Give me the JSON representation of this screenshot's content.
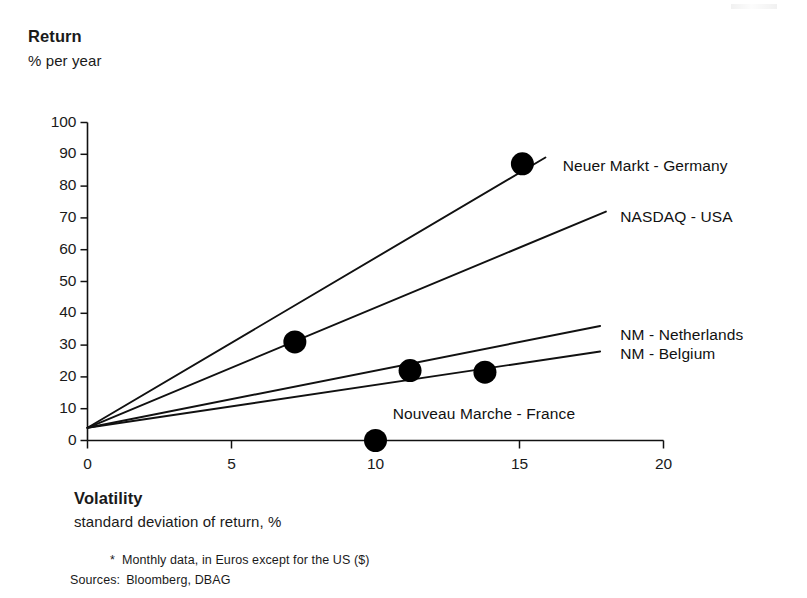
{
  "axis_titles": {
    "y_title": "Return",
    "y_subtitle": "% per year",
    "x_title": "Volatility",
    "x_subtitle": "standard deviation of return,   %"
  },
  "notes": {
    "footnote_marker": "*",
    "footnote_text": "Monthly data, in Euros except for the US ($)",
    "sources_label": "Sources:",
    "sources_text": "Bloomberg, DBAG"
  },
  "chart_data": {
    "type": "scatter",
    "title": "",
    "xlabel": "Volatility — standard deviation of return, %",
    "ylabel": "Return — % per year",
    "xlim": [
      0,
      20
    ],
    "ylim": [
      0,
      100
    ],
    "xticks": [
      0,
      5,
      10,
      15,
      20
    ],
    "yticks": [
      0,
      10,
      20,
      30,
      40,
      50,
      60,
      70,
      80,
      90,
      100
    ],
    "grid": false,
    "legend": "inline-right",
    "risk_free_intercept": 4,
    "series": [
      {
        "name": "Neuer Markt  - Germany",
        "label": "Neuer Markt  - Germany",
        "line": [
          [
            0,
            4
          ],
          [
            15.9,
            89
          ]
        ],
        "points": [
          [
            7.2,
            31
          ],
          [
            15.1,
            87
          ]
        ],
        "label_pos": [
          16.5,
          86
        ]
      },
      {
        "name": "NASDAQ - USA",
        "label": "NASDAQ - USA",
        "line": [
          [
            0,
            4
          ],
          [
            18.0,
            72
          ]
        ],
        "points": [],
        "label_pos": [
          18.5,
          70
        ]
      },
      {
        "name": "NM - Netherlands",
        "label": "NM - Netherlands",
        "line": [
          [
            0,
            4
          ],
          [
            17.8,
            36
          ]
        ],
        "points": [
          [
            11.2,
            22
          ],
          [
            13.8,
            21.5
          ]
        ],
        "label_pos": [
          18.5,
          33
        ]
      },
      {
        "name": "NM - Belgium",
        "label": "NM - Belgium",
        "line": [
          [
            0,
            4
          ],
          [
            17.8,
            28
          ]
        ],
        "points": [],
        "label_pos": [
          18.5,
          27
        ]
      },
      {
        "name": "Nouveau Marche - France",
        "label": "Nouveau Marche - France",
        "line": [],
        "points": [
          [
            10.0,
            0
          ]
        ],
        "label_pos": [
          10.6,
          8
        ]
      }
    ],
    "colors": {
      "line": "#111111",
      "marker": "#000000",
      "axis": "#111111",
      "text": "#1a1a1a",
      "background": "#ffffff"
    }
  },
  "tick_labels": {
    "y": [
      "100",
      "90",
      "80",
      "70",
      "60",
      "50",
      "40",
      "30",
      "20",
      "10",
      "0"
    ],
    "x": [
      "0",
      "5",
      "10",
      "15",
      "20"
    ]
  },
  "series_labels": {
    "germany": "Neuer Markt  - Germany",
    "usa": "NASDAQ - USA",
    "netherlands": "NM - Netherlands",
    "belgium": "NM - Belgium",
    "france": "Nouveau Marche - France"
  }
}
